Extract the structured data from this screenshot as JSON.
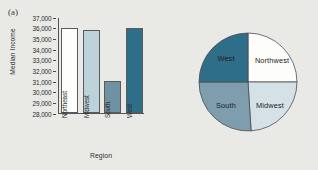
{
  "figure": {
    "panel_a_label": "(a)",
    "panel_b_label": "(b)"
  },
  "chart_data": [
    {
      "type": "bar",
      "panel": "(a)",
      "title": "",
      "xlabel": "Region",
      "ylabel": "Median Income",
      "categories": [
        "Northeast",
        "Midwest",
        "South",
        "West"
      ],
      "values": [
        36000,
        35800,
        31000,
        36000
      ],
      "ylim": [
        28000,
        37000
      ],
      "ytick_labels": [
        "37,000",
        "36,000",
        "35,000",
        "34,000",
        "33,000",
        "32,000",
        "31,000",
        "30,000",
        "29,000",
        "28,000"
      ],
      "ytick_values": [
        37000,
        36000,
        35000,
        34000,
        33000,
        32000,
        31000,
        30000,
        29000,
        28000
      ],
      "bar_colors": [
        "#fdfdfb",
        "#bcd2da",
        "#6e91a4",
        "#2f6e88"
      ],
      "grid": false,
      "legend": "none"
    },
    {
      "type": "pie",
      "panel": "(b)",
      "title": "",
      "labels": [
        "Northwest",
        "Midwest",
        "South",
        "West"
      ],
      "values": [
        25,
        24,
        26,
        25
      ],
      "slice_colors": [
        "#fdfdfb",
        "#d4e2e7",
        "#7e9eae",
        "#2f6e88"
      ],
      "start_angle_deg": 0,
      "direction": "clockwise",
      "legend": "none",
      "label_positions": [
        {
          "label": "Northwest",
          "x": 84,
          "y": 52
        },
        {
          "label": "Midwest",
          "x": 82,
          "y": 97
        },
        {
          "label": "South",
          "x": 38,
          "y": 97
        },
        {
          "label": "West",
          "x": 38,
          "y": 50
        }
      ]
    }
  ]
}
